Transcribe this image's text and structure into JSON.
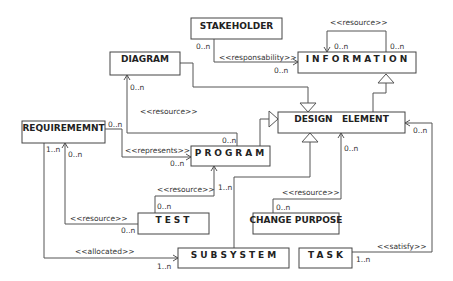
{
  "classes": {
    "stakeholder": "STAKEHOLDER",
    "information": "INFORMATION",
    "diagram": "DIAGRAM",
    "design_element": "DESIGN   ELEMENT",
    "requirement": "REQUIREMEMNT",
    "program": "PROGRAM",
    "test": "TEST",
    "change_purpose": "CHANGE PURPOSE",
    "subsystem": "SUBSYSTEM",
    "task": "TASK"
  },
  "relations": {
    "info_self": {
      "label": "<<resource>>",
      "mult_a": "0..n",
      "mult_b": "0..n"
    },
    "stakeholder_info": {
      "label": "<<responsability>>",
      "mult_src": "0..n",
      "mult_dst": "0..n"
    },
    "program_diagram": {
      "label": "<<resource>>",
      "mult_src": "0..n",
      "mult_dst": "0..n"
    },
    "req_program": {
      "label": "<<represents>>",
      "mult_src": "0..n",
      "mult_dst": "0..n"
    },
    "test_program": {
      "label": "<<resource>>",
      "mult_src": "0..n",
      "mult_dst": "1..n"
    },
    "test_req": {
      "label": "<<resource>>",
      "mult_src": "0..n",
      "mult_dst": "0..n"
    },
    "req_subsystem": {
      "label": "<<allocated>>",
      "mult_src": "1..n",
      "mult_dst": "1..n"
    },
    "change_design": {
      "label": "<<resource>>",
      "mult_src": "0..n",
      "mult_dst": "0..n"
    },
    "task_design": {
      "label": "<<satisfy>>",
      "mult_src": "1..n",
      "mult_dst": "0..n"
    }
  }
}
